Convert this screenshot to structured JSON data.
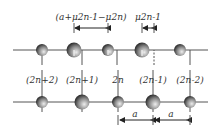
{
  "diagram": {
    "type": "diatomic-chain-lattice",
    "orientation": "rotated-180",
    "atom_labels": [
      "(2n+2)",
      "(2n+1)",
      "2n",
      "(2n-1)",
      "(2n-2)"
    ],
    "spacing_label": "a",
    "displacement_label_large": "(a+μ2n-1−μ2n)",
    "displacement_label_small": "μ2n-1",
    "colors": {
      "line": "#555555",
      "atom_dark": "#444444",
      "atom_light": "#cccccc"
    }
  }
}
